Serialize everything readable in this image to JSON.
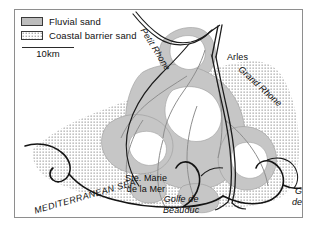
{
  "figure": {
    "type": "geological-map",
    "region": "Rhone delta, southern France",
    "frame": {
      "border_color": "#8e8e8e",
      "background": "#ffffff"
    }
  },
  "legend": {
    "items": [
      {
        "label": "Fluvial sand",
        "swatch": "solid-gray-fill",
        "color": "#b9b9b9"
      },
      {
        "label": "Coastal barrier sand",
        "swatch": "dotted-stipple-fill",
        "color": "#6b6b6b"
      }
    ],
    "scale": {
      "label": "10km",
      "length_km": 10
    }
  },
  "map_labels": {
    "rivers": [
      {
        "name": "Petit Rhone",
        "style": "italic",
        "rotation_deg": 58
      },
      {
        "name": "Grand Rhone",
        "style": "italic",
        "rotation_deg": 42
      }
    ],
    "settlements": [
      {
        "name": "Arles",
        "style": "roman"
      },
      {
        "name_line1": "Ste. Marie",
        "name_line2": "de la Mer",
        "style": "roman"
      }
    ],
    "water_bodies": [
      {
        "name_line1": "Golfe de",
        "name_line2": "Beauduc",
        "style": "italic"
      },
      {
        "name_line1": "Golfe",
        "name_line2": "de Fos",
        "style": "italic"
      },
      {
        "name": "MEDITERRANEAN SEA",
        "style": "italic-caps",
        "rotation_deg": -16
      }
    ]
  },
  "colors": {
    "coastline": "#1c1c1c",
    "river_line": "#1c1c1c",
    "fluvial_sand_fill": "#c2c2c2",
    "barrier_sand_dot": "#707070",
    "channel_outline": "#8a8a8a",
    "text": "#0d0d0d",
    "frame": "#8e8e8e"
  }
}
